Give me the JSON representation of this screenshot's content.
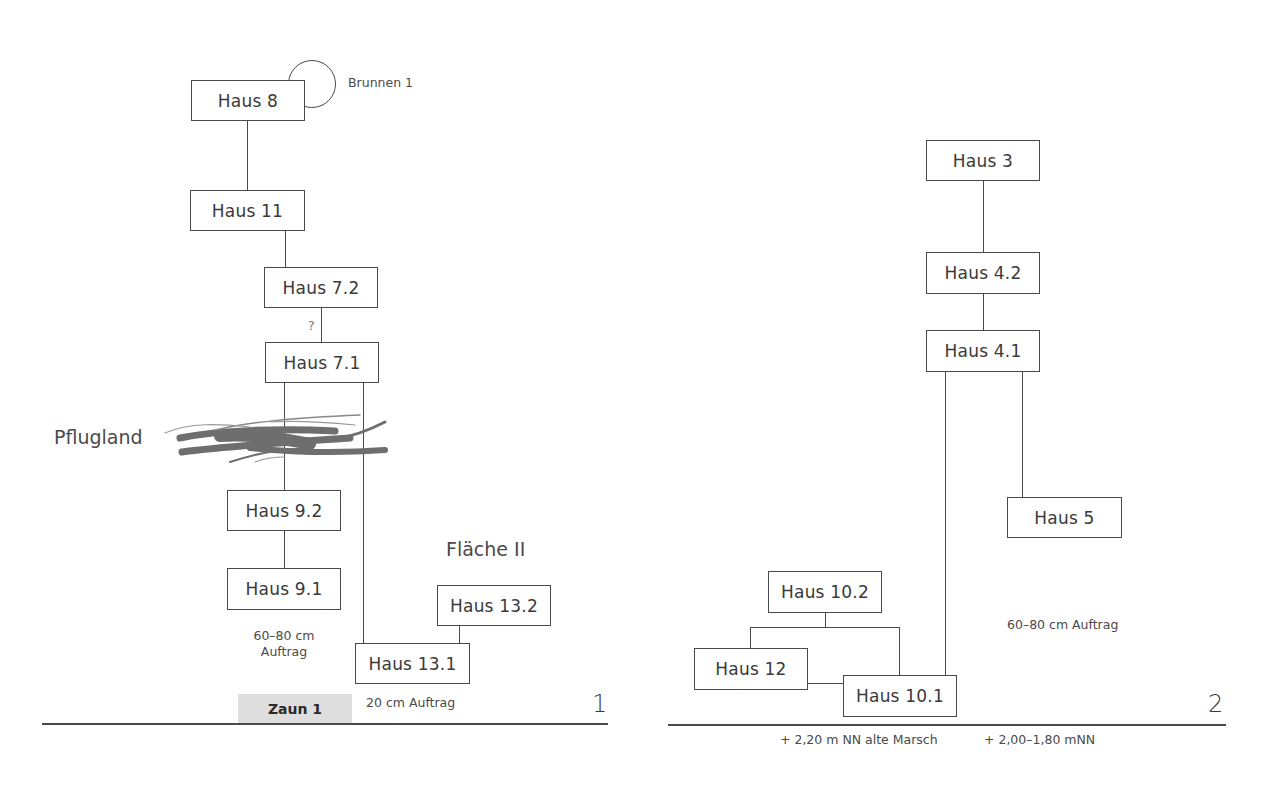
{
  "panel1": {
    "number": "1",
    "houses": {
      "h8": "Haus 8",
      "h11": "Haus 11",
      "h7_2": "Haus 7.2",
      "h7_1": "Haus 7.1",
      "h9_2": "Haus 9.2",
      "h9_1": "Haus 9.1",
      "h13_2": "Haus 13.2",
      "h13_1": "Haus 13.1"
    },
    "well_label": "Brunnen 1",
    "uncertain_mark": "?",
    "pflugland_label": "Pflugland",
    "flaeche_label": "Fläche II",
    "auftrag_60_80_line1": "60–80 cm",
    "auftrag_60_80_line2": "Auftrag",
    "auftrag_20": "20 cm Auftrag",
    "zaun_label": "Zaun 1"
  },
  "panel2": {
    "number": "2",
    "houses": {
      "h3": "Haus 3",
      "h4_2": "Haus 4.2",
      "h4_1": "Haus 4.1",
      "h5": "Haus 5",
      "h10_2": "Haus 10.2",
      "h12": "Haus 12",
      "h10_1": "Haus 10.1"
    },
    "auftrag_label": "60–80 cm Auftrag",
    "level_alte_marsch": "+ 2,20 m NN alte Marsch",
    "level_range": "+ 2,00–1,80 mNN"
  }
}
